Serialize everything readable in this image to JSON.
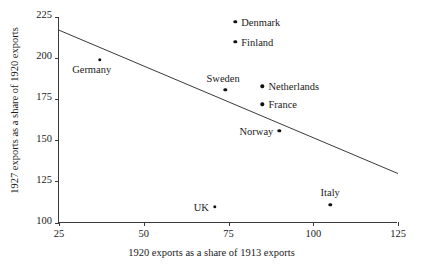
{
  "chart_data": {
    "type": "scatter",
    "title": "",
    "xlabel": "1920 exports as a share of 1913 exports",
    "ylabel": "1927 exports as a share of 1920 exports",
    "xlim": [
      25,
      125
    ],
    "ylim": [
      100,
      225
    ],
    "xticks": [
      25,
      50,
      75,
      100,
      125
    ],
    "yticks": [
      100,
      125,
      150,
      175,
      200,
      225
    ],
    "grid": false,
    "legend": false,
    "points": [
      {
        "label": "Germany",
        "x": 37,
        "y": 199,
        "label_pos": "below-left"
      },
      {
        "label": "Denmark",
        "x": 77,
        "y": 222,
        "label_pos": "right"
      },
      {
        "label": "Finland",
        "x": 77,
        "y": 210,
        "label_pos": "right"
      },
      {
        "label": "Sweden",
        "x": 74,
        "y": 181,
        "label_pos": "above-left"
      },
      {
        "label": "Netherlands",
        "x": 85,
        "y": 183,
        "label_pos": "right"
      },
      {
        "label": "France",
        "x": 85,
        "y": 172,
        "label_pos": "right"
      },
      {
        "label": "Norway",
        "x": 90,
        "y": 156,
        "label_pos": "left"
      },
      {
        "label": "UK",
        "x": 71,
        "y": 110,
        "label_pos": "left"
      },
      {
        "label": "Italy",
        "x": 105,
        "y": 111,
        "label_pos": "above"
      }
    ],
    "trendline": {
      "x1": 25,
      "y1": 217,
      "x2": 125,
      "y2": 130
    },
    "colors": {
      "point": "#111111",
      "axis": "#3a3a3a",
      "line": "#3a3a3a",
      "background": "#ffffff"
    }
  }
}
